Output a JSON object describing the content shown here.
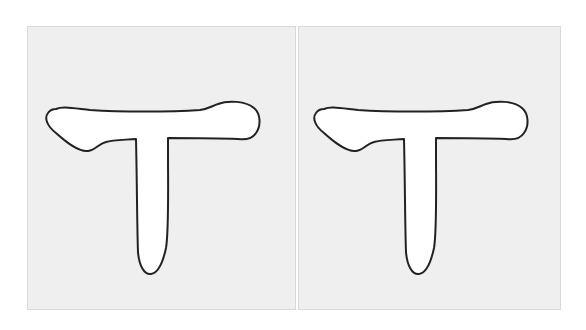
{
  "panels": [
    {
      "id": "left",
      "glyph": "T",
      "glyph_style": "outline",
      "fill_color": "#ffffff",
      "stroke_color": "#222222",
      "background_color": "#efefef",
      "border_color": "#d9d9d9"
    },
    {
      "id": "right",
      "glyph": "T",
      "glyph_style": "outline",
      "fill_color": "#ffffff",
      "stroke_color": "#222222",
      "background_color": "#efefef",
      "border_color": "#d9d9d9"
    }
  ]
}
